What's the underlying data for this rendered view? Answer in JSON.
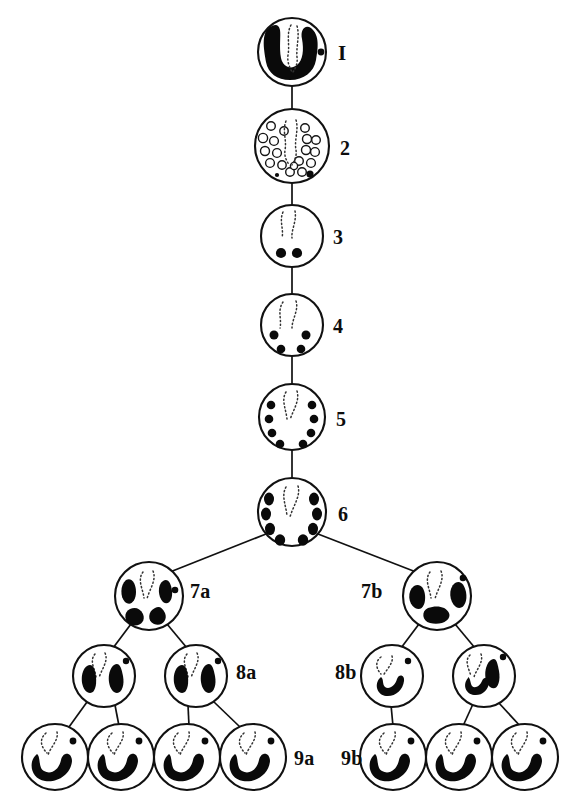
{
  "figure": {
    "background_color": "#ffffff",
    "ink_color": "#0a0a0a",
    "width": 581,
    "height": 808
  },
  "labels": {
    "stage1": "I",
    "stage2": "2",
    "stage3": "3",
    "stage4": "4",
    "stage5": "5",
    "stage6": "6",
    "stage7a": "7a",
    "stage7b": "7b",
    "stage8a": "8a",
    "stage8b": "8b",
    "stage9a": "9a",
    "stage9b": "9b"
  },
  "stages": [
    {
      "id": "stage1",
      "label": "I",
      "label_side": "right",
      "cells": 1,
      "contents": "one large horseshoe shaped dark mass, dotted spindle, one small dot",
      "cx": 292,
      "cy": 52,
      "r": 34
    },
    {
      "id": "stage2",
      "label": "2",
      "label_side": "right",
      "cells": 1,
      "contents": "about twenty small open rings, dotted spindle, one small dot",
      "cx": 292,
      "cy": 146,
      "r": 37
    },
    {
      "id": "stage3",
      "label": "3",
      "label_side": "right",
      "cells": 1,
      "contents": "two solid dots, dotted spindle",
      "cx": 292,
      "cy": 236,
      "r": 31
    },
    {
      "id": "stage4",
      "label": "4",
      "label_side": "right",
      "cells": 1,
      "contents": "four solid dots, dotted spindle",
      "cx": 292,
      "cy": 325,
      "r": 31
    },
    {
      "id": "stage5",
      "label": "5",
      "label_side": "right",
      "cells": 1,
      "contents": "eight solid dots in two arcs, dotted spindle",
      "cx": 292,
      "cy": 417,
      "r": 33
    },
    {
      "id": "stage6",
      "label": "6",
      "label_side": "right",
      "cells": 1,
      "contents": "eight enlarged dark dots in two arcs, dotted spindle",
      "cx": 292,
      "cy": 512,
      "r": 34
    },
    {
      "id": "stage7a",
      "label": "7a",
      "label_side": "right",
      "cells": 1,
      "contents": "four irregular dark blobs, dotted spindle, one small dot",
      "cx": 149,
      "cy": 596,
      "r": 34
    },
    {
      "id": "stage7b",
      "label": "7b",
      "label_side": "left",
      "cells": 1,
      "contents": "three irregular dark blobs, dotted spindle, one small dot",
      "cx": 437,
      "cy": 596,
      "r": 34
    },
    {
      "id": "stage8a",
      "label": "8a",
      "label_side": "right",
      "cells": 2,
      "contents": "two dark elongated blobs per cell, dotted spindle, one small dot",
      "cx": [
        104,
        196
      ],
      "cy": 676,
      "r": 31
    },
    {
      "id": "stage8b",
      "label": "8b",
      "label_side": "left",
      "cells": 2,
      "contents": "one curved dark blob per cell, dotted spindle, one small dot",
      "cx": [
        392,
        484
      ],
      "cy": 676,
      "r": 31
    },
    {
      "id": "stage9a",
      "label": "9a",
      "label_side": "right",
      "cells": 4,
      "contents": "one crescent dark blob per cell, dotted spindle, one small dot",
      "cx": [
        55,
        121,
        187,
        253
      ],
      "cy": 757,
      "r": 33
    },
    {
      "id": "stage9b",
      "label": "9b",
      "label_side": "left",
      "cells": 3,
      "contents": "one crescent dark blob per cell, dotted spindle, one small dot",
      "cx": [
        393,
        459,
        525
      ],
      "cy": 757,
      "r": 33
    }
  ],
  "links": [
    {
      "from": "stage1",
      "to": "stage2"
    },
    {
      "from": "stage2",
      "to": "stage3"
    },
    {
      "from": "stage3",
      "to": "stage4"
    },
    {
      "from": "stage4",
      "to": "stage5"
    },
    {
      "from": "stage5",
      "to": "stage6"
    },
    {
      "from": "stage6",
      "to": "stage7a"
    },
    {
      "from": "stage6",
      "to": "stage7b"
    },
    {
      "from": "stage7a",
      "to": "stage8a-left"
    },
    {
      "from": "stage7a",
      "to": "stage8a-right"
    },
    {
      "from": "stage7b",
      "to": "stage8b-left"
    },
    {
      "from": "stage7b",
      "to": "stage8b-right"
    },
    {
      "from": "stage8a-left",
      "to": "stage9a-1"
    },
    {
      "from": "stage8a-left",
      "to": "stage9a-2"
    },
    {
      "from": "stage8a-right",
      "to": "stage9a-3"
    },
    {
      "from": "stage8a-right",
      "to": "stage9a-4"
    },
    {
      "from": "stage8b-left",
      "to": "stage9b-1"
    },
    {
      "from": "stage8b-right",
      "to": "stage9b-2"
    },
    {
      "from": "stage8b-right",
      "to": "stage9b-3"
    }
  ],
  "label_positions": {
    "stage1": {
      "x": 338,
      "y": 60
    },
    "stage2": {
      "x": 340,
      "y": 155
    },
    "stage3": {
      "x": 333,
      "y": 244
    },
    "stage4": {
      "x": 333,
      "y": 333
    },
    "stage5": {
      "x": 336,
      "y": 426
    },
    "stage6": {
      "x": 338,
      "y": 521
    },
    "stage7a": {
      "x": 190,
      "y": 598
    },
    "stage7b": {
      "x": 361,
      "y": 598
    },
    "stage8a": {
      "x": 236,
      "y": 679
    },
    "stage8b": {
      "x": 335,
      "y": 679
    },
    "stage9a": {
      "x": 294,
      "y": 765
    },
    "stage9b": {
      "x": 341,
      "y": 765
    }
  }
}
